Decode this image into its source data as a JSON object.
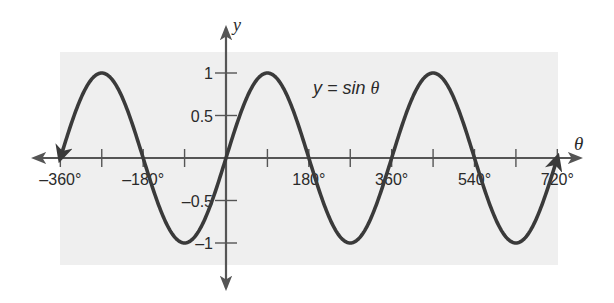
{
  "chart_data": {
    "type": "line",
    "title": "y = sin θ",
    "equation_label": {
      "prefix": "y = sin ",
      "variable": "θ"
    },
    "xlabel": "θ",
    "ylabel": "y",
    "xlim": [
      -360,
      720
    ],
    "ylim": [
      -1,
      1
    ],
    "x_ticks": [
      -360,
      -270,
      -180,
      -90,
      0,
      90,
      180,
      270,
      360,
      450,
      540,
      630,
      720
    ],
    "x_tick_labels": [
      {
        "value": -360,
        "label": "-360°"
      },
      {
        "value": -180,
        "label": "-180°"
      },
      {
        "value": 180,
        "label": "180°"
      },
      {
        "value": 360,
        "label": "360°"
      },
      {
        "value": 540,
        "label": "540°"
      },
      {
        "value": 720,
        "label": "720°"
      }
    ],
    "y_ticks": [
      -1,
      -0.5,
      0.5,
      1
    ],
    "y_tick_labels": [
      {
        "value": 1,
        "label": "1"
      },
      {
        "value": 0.5,
        "label": "0.5"
      },
      {
        "value": -0.5,
        "label": "-0.5"
      },
      {
        "value": -1,
        "label": "-1"
      }
    ],
    "grid": false,
    "legend": null,
    "series": [
      {
        "name": "y = sin θ",
        "function": "sin",
        "x": [
          -360,
          -270,
          -180,
          -90,
          0,
          90,
          180,
          270,
          360,
          450,
          540,
          630,
          720
        ],
        "values": [
          0,
          1,
          0,
          -1,
          0,
          1,
          0,
          -1,
          0,
          1,
          0,
          -1,
          0
        ],
        "end_arrows": true
      }
    ],
    "colors": {
      "background_panel": "#efefef",
      "curve": "#3a3a3a",
      "axes": "#555555",
      "text": "#2a2a2a"
    }
  }
}
